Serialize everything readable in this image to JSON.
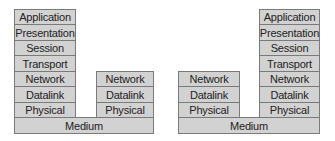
{
  "diagram": {
    "title": "",
    "stacks": [
      {
        "name": "host-a",
        "layers": [
          "Application",
          "Presentation",
          "Session",
          "Transport",
          "Network",
          "Datalink",
          "Physical"
        ]
      },
      {
        "name": "router-a",
        "layers": [
          "Network",
          "Datalink",
          "Physical"
        ]
      },
      {
        "name": "router-b",
        "layers": [
          "Network",
          "Datalink",
          "Physical"
        ]
      },
      {
        "name": "host-b",
        "layers": [
          "Application",
          "Presentation",
          "Session",
          "Transport",
          "Network",
          "Datalink",
          "Physical"
        ]
      }
    ],
    "media": [
      {
        "name": "medium-left",
        "label": "Medium"
      },
      {
        "name": "medium-right",
        "label": "Medium"
      }
    ]
  }
}
